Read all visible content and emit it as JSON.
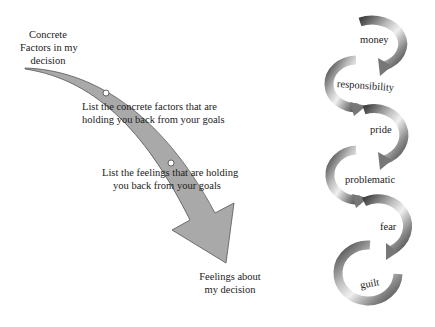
{
  "left_diagram": {
    "start_label": [
      "Concrete",
      "Factors in my",
      "decision"
    ],
    "mid_label_1": [
      "List the concrete factors that are",
      "holding you back from your goals"
    ],
    "mid_label_2": [
      "List the feelings that are holding",
      "you back from your goals"
    ],
    "end_label": [
      "Feelings about",
      "my decision"
    ],
    "arrow_color": "#a8a8a8",
    "arrow_outline": "#555555"
  },
  "right_diagram": {
    "spiral_items": [
      {
        "label": "money"
      },
      {
        "label": "responsibility"
      },
      {
        "label": "pride"
      },
      {
        "label": "problematic"
      },
      {
        "label": "fear"
      },
      {
        "label": "guilt"
      }
    ],
    "ring_color_dark": "#4a4a4a",
    "ring_color_light": "#d8d8d8"
  }
}
